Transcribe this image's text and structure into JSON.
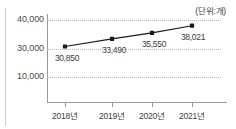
{
  "chart_data": {
    "type": "line",
    "title": "",
    "subtitle": "",
    "unit_label": "(단위:개)",
    "xlabel": "",
    "ylabel": "",
    "categories": [
      "2018년",
      "2019년",
      "2020년",
      "2021년"
    ],
    "values": [
      30850,
      33490,
      35550,
      38021
    ],
    "data_labels": [
      "30,850",
      "33,490",
      "35,550",
      "38,021"
    ],
    "y_ticks": [
      {
        "value": 40000,
        "label": "40,000"
      },
      {
        "value": 30000,
        "label": "30,000"
      },
      {
        "value": 10000,
        "label": "10,000"
      }
    ],
    "ylim": [
      0,
      44000
    ],
    "grid": "horizontal-dotted",
    "legend": "none",
    "series": [
      {
        "name": "개수",
        "values": [
          30850,
          33490,
          35550,
          38021
        ],
        "marker": "square",
        "line_color": "#1a1a1a",
        "marker_color": "#1a1a1a"
      }
    ],
    "colors": {
      "line": "#1a1a1a",
      "marker": "#1a1a1a",
      "axis": "#9a9a9a",
      "gridline": "#b9b9b9",
      "text": "#3d3d3d",
      "background": "#ffffff"
    }
  }
}
